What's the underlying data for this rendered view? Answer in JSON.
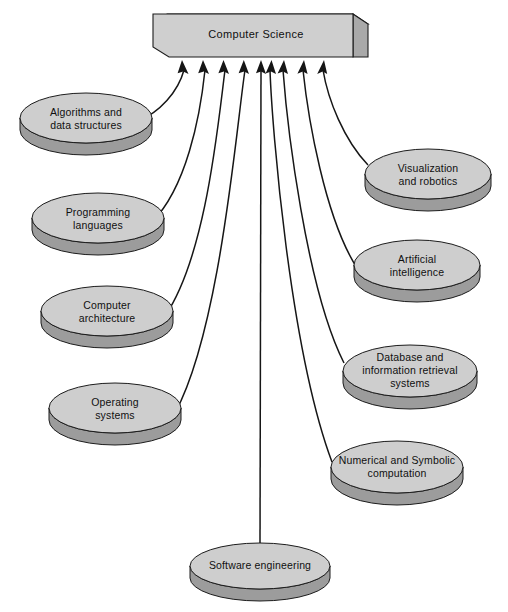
{
  "diagram": {
    "title": "Computer Science",
    "type": "radial-convergence-diagram",
    "root": {
      "label": "Computer Science",
      "shape": "3d-box"
    },
    "colors": {
      "background": "#ffffff",
      "box_front": "#cfcfcf",
      "box_top": "#dcdcdc",
      "box_side": "#a9a9a9",
      "cylinder_top": "#cecece",
      "cylinder_body": "#9c9c9c",
      "outline": "#1c1c1c",
      "text": "#101010",
      "connector": "#161616"
    },
    "nodes": [
      {
        "id": "algorithms",
        "lines": [
          "Algorithms and",
          "data structures"
        ],
        "column": "left",
        "order": 1
      },
      {
        "id": "programming-languages",
        "lines": [
          "Programming",
          "languages"
        ],
        "column": "left",
        "order": 2
      },
      {
        "id": "computer-architecture",
        "lines": [
          "Computer",
          "architecture"
        ],
        "column": "left",
        "order": 3
      },
      {
        "id": "operating-systems",
        "lines": [
          "Operating",
          "systems"
        ],
        "column": "left",
        "order": 4
      },
      {
        "id": "visualization-robotics",
        "lines": [
          "Visualization",
          "and robotics"
        ],
        "column": "right",
        "order": 1
      },
      {
        "id": "artificial-intelligence",
        "lines": [
          "Artificial",
          "intelligence"
        ],
        "column": "right",
        "order": 2
      },
      {
        "id": "database-information-retrieval",
        "lines": [
          "Database and",
          "information retrieval",
          "systems"
        ],
        "column": "right",
        "order": 3
      },
      {
        "id": "numerical-symbolic",
        "lines": [
          "Numerical and Symbolic",
          "computation"
        ],
        "column": "right",
        "order": 4
      },
      {
        "id": "software-engineering",
        "lines": [
          "Software engineering"
        ],
        "column": "bottom",
        "order": 1
      }
    ],
    "arrow_count": 9
  }
}
